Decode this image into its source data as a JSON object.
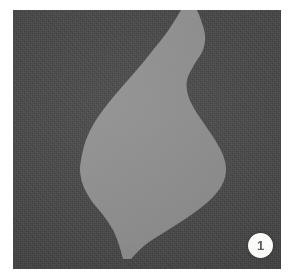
{
  "figure": {
    "caption_badge": "1",
    "panel": {
      "label": "textured-dark-background-photo",
      "background_color": "#4a4a4a",
      "shape_color": "#8e8e8e",
      "margin_color": "#ffffff"
    },
    "badge": {
      "number": "1",
      "background_color": "#fbfbfa",
      "text_color": "#5b5b5b"
    },
    "shape": {
      "name": "light-gray-organic-silhouette",
      "description": "vertical vase-like light gray region running top to bottom of the panel"
    }
  },
  "chart_data": {
    "type": "area",
    "title": "",
    "xlabel": "",
    "ylabel": "",
    "grid": false,
    "legend": null,
    "colors": {
      "background": "#4a4a4a",
      "region": "#8e8e8e"
    },
    "x": [
      0,
      10,
      25,
      40,
      55,
      70,
      85,
      100,
      115,
      130,
      145,
      160,
      175,
      190,
      205,
      220,
      235,
      249
    ],
    "series": [
      {
        "name": "left-boundary",
        "values": [
          168,
          162,
          152,
          140,
          128,
          115,
          102,
          90,
          80,
          73,
          69,
          67,
          70,
          78,
          90,
          100,
          106,
          110
        ]
      },
      {
        "name": "right-boundary",
        "values": [
          184,
          188,
          192,
          190,
          181,
          174,
          175,
          182,
          192,
          202,
          210,
          213,
          209,
          197,
          178,
          155,
          132,
          118
        ]
      }
    ]
  }
}
